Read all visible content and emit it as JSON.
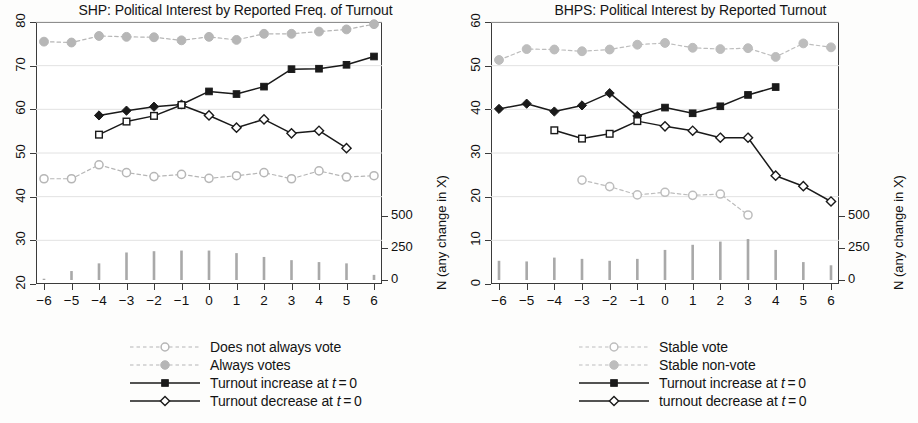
{
  "chart_data": [
    {
      "type": "line",
      "panel_id": "SHP",
      "title": "SHP: Political Interest by Reported Freq. of Turnout",
      "xlabel": "",
      "ylabel": "",
      "y2label": "N (any change in X)",
      "x": [
        -6,
        -5,
        -4,
        -3,
        -2,
        -1,
        0,
        1,
        2,
        3,
        4,
        5,
        6
      ],
      "xticks": [
        "−6",
        "−5",
        "−4",
        "−3",
        "−2",
        "−1",
        "0",
        "1",
        "2",
        "3",
        "4",
        "5",
        "6"
      ],
      "ylim": [
        20,
        80
      ],
      "yticks": [
        20,
        30,
        40,
        50,
        60,
        70,
        80
      ],
      "y2lim": [
        0,
        500
      ],
      "y2ticks": [
        0,
        250,
        500
      ],
      "grid": true,
      "legend_position": "below",
      "series": [
        {
          "name": "Does not always vote",
          "style": "dashed",
          "marker": "open-circle",
          "color": "#b6b6b6",
          "x": [
            -6,
            -5,
            -4,
            -3,
            -2,
            -1,
            0,
            1,
            2,
            3,
            4,
            5,
            6
          ],
          "values": [
            44.1,
            44.1,
            47.3,
            45.5,
            44.6,
            45.1,
            44.2,
            44.8,
            45.5,
            44.1,
            45.9,
            44.5,
            44.8
          ]
        },
        {
          "name": "Always votes",
          "style": "dashed",
          "marker": "filled-circle",
          "color": "#b6b6b6",
          "x": [
            -6,
            -5,
            -4,
            -3,
            -2,
            -1,
            0,
            1,
            2,
            3,
            4,
            5,
            6
          ],
          "values": [
            75.5,
            75.3,
            76.8,
            76.6,
            76.5,
            75.8,
            76.6,
            75.9,
            77.3,
            77.3,
            77.8,
            78.3,
            79.5
          ]
        },
        {
          "name": "Turnout increase at t=0",
          "style": "solid",
          "marker": "filled-square",
          "pre_marker": "filled-diamond",
          "color": "#1a1a1a",
          "x": [
            -4,
            -3,
            -2,
            -1,
            0,
            1,
            2,
            3,
            4,
            5,
            6
          ],
          "values": [
            58.6,
            59.7,
            60.6,
            61.1,
            64.1,
            63.5,
            65.2,
            69.2,
            69.3,
            70.2,
            72.1
          ]
        },
        {
          "name": "Turnout decrease at t=0",
          "style": "solid",
          "marker": "open-diamond",
          "pre_marker": "open-square",
          "color": "#1a1a1a",
          "x": [
            -4,
            -3,
            -2,
            -1,
            0,
            1,
            2,
            3,
            4,
            5
          ],
          "values": [
            54.2,
            57.2,
            58.5,
            61.0,
            58.6,
            55.8,
            57.7,
            54.5,
            55.1,
            51.1
          ]
        }
      ],
      "bars": {
        "name": "N (any change in X)",
        "color": "#9a9a9a",
        "x": [
          -6,
          -5,
          -4,
          -3,
          -2,
          -1,
          0,
          1,
          2,
          3,
          4,
          5,
          6
        ],
        "values": [
          10,
          70,
          130,
          215,
          225,
          230,
          230,
          210,
          180,
          155,
          140,
          130,
          40
        ]
      },
      "legend": [
        {
          "label": "Does not always vote",
          "style": "dashed",
          "marker": "open-circle",
          "color": "#b6b6b6"
        },
        {
          "label": "Always votes",
          "style": "dashed",
          "marker": "filled-circle",
          "color": "#b6b6b6"
        },
        {
          "label": "Turnout increase at t=0",
          "style": "solid",
          "marker": "filled-square",
          "color": "#1a1a1a"
        },
        {
          "label": "Turnout decrease at t=0",
          "style": "solid",
          "marker": "open-diamond",
          "color": "#1a1a1a"
        }
      ]
    },
    {
      "type": "line",
      "panel_id": "BHPS",
      "title": "BHPS: Political Interest by Reported Turnout",
      "xlabel": "",
      "ylabel": "",
      "y2label": "N (any change in X)",
      "x": [
        -6,
        -5,
        -4,
        -3,
        -2,
        -1,
        0,
        1,
        2,
        3,
        4,
        5,
        6
      ],
      "xticks": [
        "−6",
        "−5",
        "−4",
        "−3",
        "−2",
        "−1",
        "0",
        "1",
        "2",
        "3",
        "4",
        "5",
        "6"
      ],
      "ylim": [
        0,
        60
      ],
      "yticks": [
        0,
        10,
        20,
        30,
        40,
        50,
        60
      ],
      "y2lim": [
        0,
        500
      ],
      "y2ticks": [
        0,
        250,
        500
      ],
      "grid": true,
      "legend_position": "below",
      "series": [
        {
          "name": "Stable vote",
          "style": "dashed",
          "marker": "open-circle",
          "color": "#bdbdbd",
          "x": [
            -3,
            -2,
            -1,
            0,
            1,
            2,
            3
          ],
          "values": [
            23.8,
            22.3,
            20.4,
            21.0,
            20.3,
            20.6,
            15.8
          ]
        },
        {
          "name": "Stable non-vote",
          "style": "dashed",
          "marker": "filled-circle",
          "color": "#bdbdbd",
          "x": [
            -6,
            -5,
            -4,
            -3,
            -2,
            -1,
            0,
            1,
            2,
            3,
            4,
            5,
            6
          ],
          "values": [
            51.3,
            53.8,
            53.7,
            53.3,
            53.7,
            54.8,
            55.2,
            54.1,
            53.8,
            54.0,
            52.0,
            55.1,
            54.2
          ]
        },
        {
          "name": "Turnout increase at t=0",
          "style": "solid",
          "marker": "filled-square",
          "pre_marker": "filled-diamond",
          "color": "#1a1a1a",
          "x": [
            -6,
            -5,
            -4,
            -3,
            -2,
            -1,
            0,
            1,
            2,
            3,
            4
          ],
          "values": [
            40.1,
            41.3,
            39.5,
            40.9,
            43.7,
            38.5,
            40.4,
            39.1,
            40.7,
            43.3,
            45.1
          ]
        },
        {
          "name": "turnout decrease at t=0",
          "style": "solid",
          "marker": "open-diamond",
          "pre_marker": "open-square",
          "color": "#1a1a1a",
          "x": [
            -4,
            -3,
            -2,
            -1,
            0,
            1,
            2,
            3,
            4,
            5,
            6
          ],
          "values": [
            35.2,
            33.3,
            34.4,
            37.3,
            36.1,
            35.1,
            33.5,
            33.5,
            24.8,
            22.4,
            18.9
          ]
        }
      ],
      "bars": {
        "name": "N (any change in X)",
        "color": "#9a9a9a",
        "x": [
          -6,
          -5,
          -4,
          -3,
          -2,
          -1,
          0,
          1,
          2,
          3,
          4,
          5,
          6
        ],
        "values": [
          150,
          145,
          175,
          165,
          150,
          165,
          235,
          275,
          300,
          320,
          235,
          140,
          115,
          45
        ]
      },
      "legend": [
        {
          "label": "Stable vote",
          "style": "dashed",
          "marker": "open-circle",
          "color": "#bdbdbd"
        },
        {
          "label": "Stable non-vote",
          "style": "dashed",
          "marker": "filled-circle",
          "color": "#bdbdbd"
        },
        {
          "label": "Turnout increase at t=0",
          "style": "solid",
          "marker": "filled-square",
          "color": "#1a1a1a"
        },
        {
          "label": "turnout decrease at t=0",
          "style": "solid",
          "marker": "open-diamond",
          "color": "#1a1a1a"
        }
      ]
    }
  ]
}
